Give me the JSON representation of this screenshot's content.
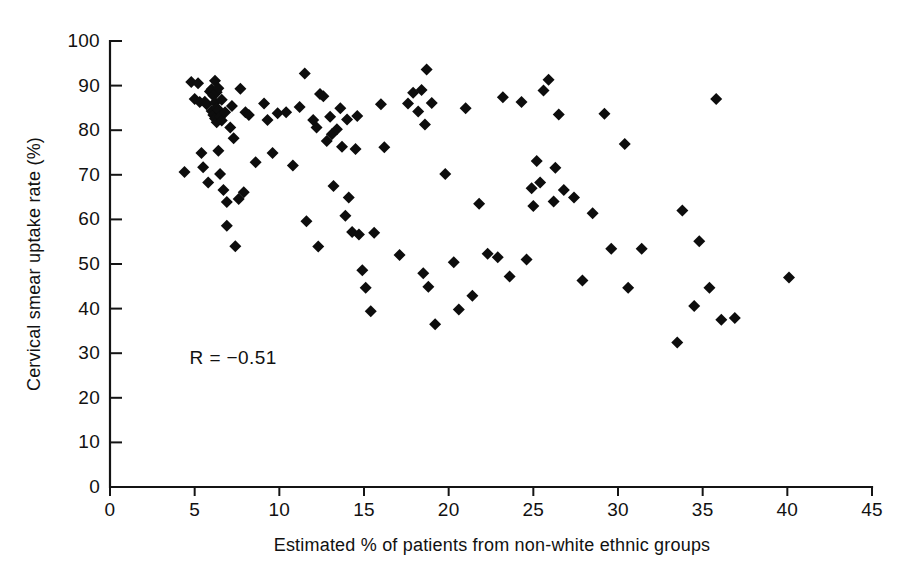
{
  "chart_data": {
    "type": "scatter",
    "title": "",
    "xlabel": "Estimated % of patients from non-white ethnic groups",
    "ylabel": "Cervical smear uptake rate (%)",
    "xlim": [
      0,
      45
    ],
    "ylim": [
      0,
      100
    ],
    "xticks": [
      0,
      5,
      10,
      15,
      20,
      25,
      30,
      35,
      40,
      45
    ],
    "yticks": [
      0,
      10,
      20,
      30,
      40,
      50,
      60,
      70,
      80,
      90,
      100
    ],
    "xtick_labels": [
      "0",
      "5",
      "10",
      "15",
      "20",
      "25",
      "30",
      "35",
      "40",
      "45"
    ],
    "ytick_labels": [
      "0",
      "10",
      "20",
      "30",
      "40",
      "50",
      "60",
      "70",
      "80",
      "90",
      "100"
    ],
    "grid": false,
    "legend": null,
    "marker": "diamond",
    "marker_color": "#0d0d0d",
    "marker_size": 9,
    "annotations": [
      {
        "text": "R = −0.51",
        "x": 4.7,
        "y": 27.5
      }
    ],
    "series": [
      {
        "name": "General practices",
        "points": [
          [
            4.4,
            70.6
          ],
          [
            4.8,
            90.8
          ],
          [
            5.0,
            87.0
          ],
          [
            5.2,
            90.5
          ],
          [
            5.3,
            86.3
          ],
          [
            5.4,
            74.9
          ],
          [
            5.5,
            71.7
          ],
          [
            5.6,
            86.4
          ],
          [
            5.7,
            85.8
          ],
          [
            5.8,
            68.3
          ],
          [
            5.9,
            88.7
          ],
          [
            6.0,
            89.2
          ],
          [
            6.0,
            84.3
          ],
          [
            6.1,
            87.8
          ],
          [
            6.1,
            83.4
          ],
          [
            6.2,
            91.1
          ],
          [
            6.2,
            86.2
          ],
          [
            6.2,
            82.6
          ],
          [
            6.3,
            88.5
          ],
          [
            6.3,
            85.0
          ],
          [
            6.3,
            81.8
          ],
          [
            6.4,
            89.4
          ],
          [
            6.4,
            84.6
          ],
          [
            6.4,
            75.4
          ],
          [
            6.5,
            83.0
          ],
          [
            6.5,
            70.2
          ],
          [
            6.6,
            86.8
          ],
          [
            6.6,
            82.2
          ],
          [
            6.7,
            66.6
          ],
          [
            6.8,
            84.0
          ],
          [
            6.9,
            63.9
          ],
          [
            6.9,
            58.6
          ],
          [
            7.1,
            80.6
          ],
          [
            7.2,
            85.4
          ],
          [
            7.3,
            78.2
          ],
          [
            7.4,
            54.0
          ],
          [
            7.6,
            64.6
          ],
          [
            7.7,
            89.3
          ],
          [
            7.9,
            66.1
          ],
          [
            8.0,
            84.0
          ],
          [
            8.2,
            83.4
          ],
          [
            8.6,
            72.8
          ],
          [
            9.1,
            86.0
          ],
          [
            9.3,
            82.3
          ],
          [
            9.6,
            74.9
          ],
          [
            9.9,
            83.8
          ],
          [
            10.4,
            84.0
          ],
          [
            10.8,
            72.1
          ],
          [
            11.2,
            85.2
          ],
          [
            11.5,
            92.7
          ],
          [
            11.6,
            59.6
          ],
          [
            12.0,
            82.3
          ],
          [
            12.2,
            80.6
          ],
          [
            12.3,
            53.9
          ],
          [
            12.4,
            88.1
          ],
          [
            12.6,
            87.6
          ],
          [
            12.8,
            77.6
          ],
          [
            13.0,
            83.0
          ],
          [
            13.1,
            79.1
          ],
          [
            13.2,
            67.5
          ],
          [
            13.4,
            80.2
          ],
          [
            13.6,
            84.9
          ],
          [
            13.7,
            76.3
          ],
          [
            13.9,
            60.8
          ],
          [
            14.0,
            82.4
          ],
          [
            14.1,
            64.9
          ],
          [
            14.3,
            57.2
          ],
          [
            14.5,
            75.8
          ],
          [
            14.6,
            83.2
          ],
          [
            14.7,
            56.6
          ],
          [
            14.9,
            48.6
          ],
          [
            15.1,
            44.7
          ],
          [
            15.4,
            39.4
          ],
          [
            15.6,
            57.0
          ],
          [
            16.0,
            85.8
          ],
          [
            16.2,
            76.2
          ],
          [
            17.1,
            52.0
          ],
          [
            17.6,
            86.0
          ],
          [
            17.9,
            88.4
          ],
          [
            18.2,
            84.2
          ],
          [
            18.4,
            89.0
          ],
          [
            18.5,
            47.9
          ],
          [
            18.6,
            81.3
          ],
          [
            18.7,
            93.6
          ],
          [
            18.8,
            44.9
          ],
          [
            19.0,
            86.1
          ],
          [
            19.2,
            36.5
          ],
          [
            19.8,
            70.2
          ],
          [
            20.3,
            50.4
          ],
          [
            20.6,
            39.8
          ],
          [
            21.0,
            84.9
          ],
          [
            21.4,
            42.9
          ],
          [
            21.8,
            63.5
          ],
          [
            22.3,
            52.3
          ],
          [
            22.9,
            51.5
          ],
          [
            23.2,
            87.4
          ],
          [
            23.6,
            47.2
          ],
          [
            24.3,
            86.3
          ],
          [
            24.6,
            51.0
          ],
          [
            24.9,
            67.0
          ],
          [
            25.0,
            63.0
          ],
          [
            25.2,
            73.1
          ],
          [
            25.4,
            68.3
          ],
          [
            25.6,
            88.9
          ],
          [
            25.9,
            91.3
          ],
          [
            26.2,
            64.0
          ],
          [
            26.3,
            71.6
          ],
          [
            26.5,
            83.5
          ],
          [
            26.8,
            66.6
          ],
          [
            27.4,
            64.9
          ],
          [
            27.9,
            46.3
          ],
          [
            28.5,
            61.4
          ],
          [
            29.2,
            83.7
          ],
          [
            29.6,
            53.4
          ],
          [
            30.4,
            76.9
          ],
          [
            30.6,
            44.7
          ],
          [
            31.4,
            53.4
          ],
          [
            33.5,
            32.4
          ],
          [
            33.8,
            62.0
          ],
          [
            34.5,
            40.6
          ],
          [
            34.8,
            55.1
          ],
          [
            35.4,
            44.7
          ],
          [
            35.8,
            87.0
          ],
          [
            36.1,
            37.5
          ],
          [
            36.9,
            37.9
          ],
          [
            40.1,
            47.0
          ]
        ]
      }
    ]
  },
  "figure": {
    "background": "#ffffff",
    "foreground": "#111111"
  }
}
